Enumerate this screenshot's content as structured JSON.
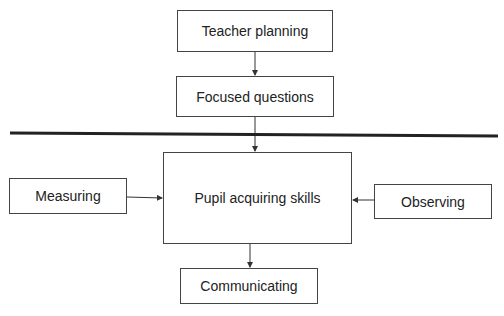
{
  "diagram": {
    "nodes": {
      "teacher_planning": "Teacher planning",
      "focused_questions": "Focused questions",
      "pupil_acquiring_skills": "Pupil acquiring skills",
      "measuring": "Measuring",
      "observing": "Observing",
      "communicating": "Communicating"
    },
    "edges": [
      {
        "from": "teacher_planning",
        "to": "focused_questions"
      },
      {
        "from": "focused_questions",
        "to": "pupil_acquiring_skills"
      },
      {
        "from": "measuring",
        "to": "pupil_acquiring_skills"
      },
      {
        "from": "observing",
        "to": "pupil_acquiring_skills"
      },
      {
        "from": "pupil_acquiring_skills",
        "to": "communicating"
      }
    ],
    "colors": {
      "line": "#333333",
      "divider": "#222222"
    }
  }
}
